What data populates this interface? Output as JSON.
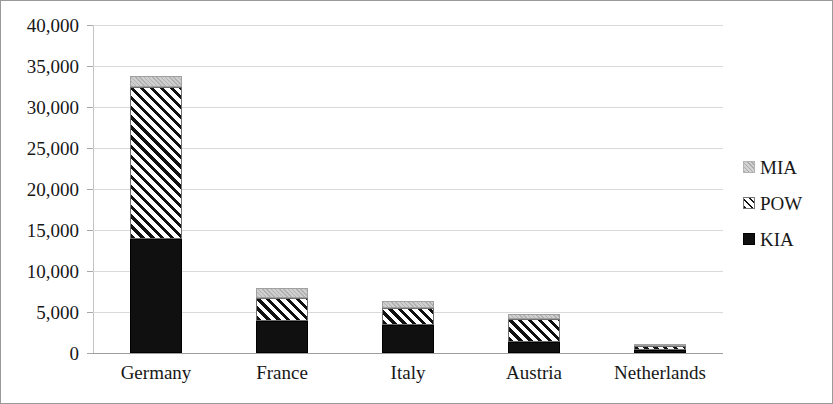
{
  "chart_data": {
    "type": "bar",
    "subtype": "stacked-bar",
    "title": "",
    "subtitle": "",
    "xlabel": "",
    "ylabel": "",
    "categories": [
      "Germany",
      "France",
      "Italy",
      "Austria",
      "Netherlands"
    ],
    "series": [
      {
        "name": "KIA",
        "values": [
          13900,
          3900,
          3400,
          1350,
          350
        ]
      },
      {
        "name": "POW",
        "values": [
          18500,
          2800,
          2100,
          2800,
          500
        ]
      },
      {
        "name": "MIA",
        "values": [
          1350,
          1200,
          850,
          600,
          100
        ]
      }
    ],
    "stack_order_bottom_to_top": [
      "KIA",
      "POW",
      "MIA"
    ],
    "totals": [
      33750,
      7900,
      6350,
      4750,
      950
    ],
    "ylim": [
      0,
      40000
    ],
    "ytick_step": 5000,
    "ytick_labels": [
      "0",
      "5,000",
      "10,000",
      "15,000",
      "20,000",
      "25,000",
      "30,000",
      "35,000",
      "40,000"
    ],
    "ytick_values": [
      0,
      5000,
      10000,
      15000,
      20000,
      25000,
      30000,
      35000,
      40000
    ],
    "grid": true,
    "legend_position": "right",
    "legend": [
      {
        "label": "MIA",
        "swatch": "light-gray-fill"
      },
      {
        "label": "POW",
        "swatch": "diagonal-hatch-fill"
      },
      {
        "label": "KIA",
        "swatch": "black-fill"
      }
    ],
    "colors": {
      "kia": "#101010",
      "pow": "#ffffff",
      "pow_hatch": "#111111",
      "mia": "#c2c2c2",
      "gridline": "#d9d9d9",
      "axis": "#9d9d9d",
      "text": "#171717",
      "background": "#ffffff",
      "border": "#9a9a9a"
    }
  }
}
